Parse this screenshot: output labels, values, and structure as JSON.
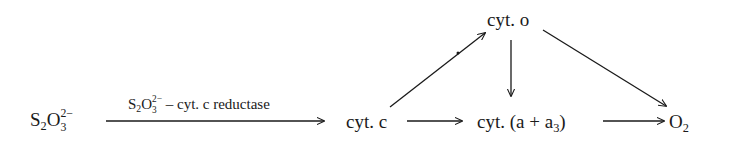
{
  "diagram": {
    "type": "reaction-pathway",
    "nodes": {
      "thiosulfate": {
        "base": "S",
        "sub1": "2",
        "mid": "O",
        "sub2": "3",
        "sup": "2−"
      },
      "cyt_c": {
        "text": "cyt. c"
      },
      "cyt_o": {
        "text": "cyt. o"
      },
      "cyt_aa3": {
        "prefix": "cyt. (a + a",
        "sub": "3",
        "suffix": ")"
      },
      "oxygen": {
        "base": "O",
        "sub": "2"
      }
    },
    "edges": [
      {
        "from": "thiosulfate",
        "to": "cyt_c",
        "label": "S2O3 2− – cyt. c reductase"
      },
      {
        "from": "cyt_c",
        "to": "cyt_aa3"
      },
      {
        "from": "cyt_aa3",
        "to": "oxygen"
      },
      {
        "from": "cyt_c",
        "to": "cyt_o"
      },
      {
        "from": "cyt_o",
        "to": "cyt_aa3"
      },
      {
        "from": "cyt_o",
        "to": "oxygen"
      }
    ],
    "enzyme_label": {
      "base": "S",
      "sub1": "2",
      "mid": "O",
      "sub2": "3",
      "sup": "2−",
      "rest": " – cyt. c reductase"
    },
    "colors": {
      "ink": "#1a1a1a",
      "background": "#ffffff"
    }
  }
}
